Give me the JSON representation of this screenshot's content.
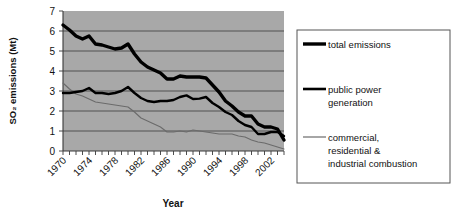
{
  "chart_data": {
    "type": "line",
    "title": "",
    "xlabel": "Year",
    "ylabel": "SO2 emissions (Mt)",
    "ylabel_display": "SO₂ emissions (Mt)",
    "xlim": [
      1970,
      2004
    ],
    "ylim": [
      0,
      7
    ],
    "yticks": [
      0,
      1,
      2,
      3,
      4,
      5,
      6,
      7
    ],
    "ytick_labels": [
      "0",
      "1",
      "2",
      "3",
      "4",
      "5",
      "6",
      "7"
    ],
    "xticks": [
      1970,
      1974,
      1978,
      1982,
      1986,
      1990,
      1994,
      1998,
      2002
    ],
    "xtick_labels": [
      "1970",
      "1974",
      "1978",
      "1982",
      "1986",
      "1990",
      "1994",
      "1998",
      "2002"
    ],
    "xtick_rotation": 45,
    "minor_xticks_every": 1,
    "grid": "horizontal",
    "plot_background": "#a8a8a8",
    "legend_position": "right-outside",
    "x": [
      1970,
      1971,
      1972,
      1973,
      1974,
      1975,
      1976,
      1977,
      1978,
      1979,
      1980,
      1981,
      1982,
      1983,
      1984,
      1985,
      1986,
      1987,
      1988,
      1989,
      1990,
      1991,
      1992,
      1993,
      1994,
      1995,
      1996,
      1997,
      1998,
      1999,
      2000,
      2001,
      2002,
      2003,
      2004
    ],
    "series": [
      {
        "name": "total emissions",
        "style": "thick-black",
        "color": "#000000",
        "values": [
          6.3,
          6.05,
          5.75,
          5.6,
          5.75,
          5.35,
          5.3,
          5.2,
          5.1,
          5.15,
          5.35,
          4.85,
          4.45,
          4.2,
          4.05,
          3.9,
          3.6,
          3.6,
          3.75,
          3.7,
          3.7,
          3.7,
          3.65,
          3.3,
          2.95,
          2.5,
          2.25,
          1.95,
          1.75,
          1.75,
          1.35,
          1.2,
          1.2,
          1.1,
          0.55
        ]
      },
      {
        "name": "public power generation",
        "style": "medium-black",
        "color": "#000000",
        "values": [
          2.9,
          2.9,
          2.95,
          3.0,
          3.15,
          2.9,
          2.9,
          2.85,
          2.9,
          3.0,
          3.2,
          2.9,
          2.65,
          2.5,
          2.45,
          2.5,
          2.5,
          2.55,
          2.7,
          2.78,
          2.6,
          2.62,
          2.7,
          2.4,
          2.2,
          1.95,
          1.8,
          1.5,
          1.3,
          1.2,
          0.85,
          0.85,
          0.95,
          0.95,
          0.75
        ]
      },
      {
        "name": "commercial, residential & industrial combustion",
        "style": "thin-gray",
        "color": "#6b6b6b",
        "values": [
          3.4,
          3.1,
          2.85,
          2.75,
          2.6,
          2.45,
          2.4,
          2.35,
          2.3,
          2.25,
          2.2,
          1.95,
          1.65,
          1.5,
          1.35,
          1.2,
          0.95,
          0.95,
          1.0,
          0.95,
          1.05,
          1.0,
          0.95,
          0.9,
          0.85,
          0.85,
          0.85,
          0.75,
          0.7,
          0.55,
          0.45,
          0.4,
          0.3,
          0.2,
          0.1
        ]
      }
    ],
    "legend": [
      {
        "label": "total emissions",
        "style": "thick-black"
      },
      {
        "label": "public power\ngeneration",
        "style": "medium-black",
        "line1": "public power",
        "line2": "generation"
      },
      {
        "label": "commercial, residential & industrial combustion",
        "style": "thin-gray",
        "line1": "commercial,",
        "line2": "residential &",
        "line3": "industrial combustion"
      }
    ]
  }
}
